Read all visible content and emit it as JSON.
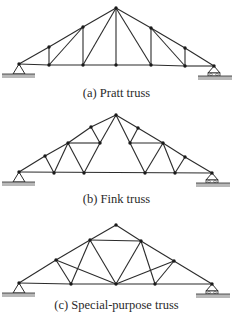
{
  "colors": {
    "member": "#2b2b2b",
    "node": "#1a1a1a",
    "ground": "#b8b8b8"
  },
  "figures": [
    {
      "id": "pratt",
      "caption": "(a) Pratt truss",
      "caption_y": 93,
      "nodes": [
        [
          19,
          64
        ],
        [
          49,
          47
        ],
        [
          83,
          27
        ],
        [
          116,
          8
        ],
        [
          151,
          28
        ],
        [
          185,
          48
        ],
        [
          214,
          66
        ],
        [
          49,
          65
        ],
        [
          83,
          65
        ],
        [
          116,
          65
        ],
        [
          151,
          65
        ],
        [
          185,
          66
        ]
      ],
      "members": [
        [
          0,
          1
        ],
        [
          1,
          2
        ],
        [
          2,
          3
        ],
        [
          3,
          4
        ],
        [
          4,
          5
        ],
        [
          5,
          6
        ],
        [
          0,
          7
        ],
        [
          7,
          8
        ],
        [
          8,
          9
        ],
        [
          9,
          10
        ],
        [
          10,
          11
        ],
        [
          11,
          6
        ],
        [
          1,
          7
        ],
        [
          2,
          8
        ],
        [
          3,
          9
        ],
        [
          4,
          10
        ],
        [
          5,
          11
        ],
        [
          7,
          2
        ],
        [
          8,
          3
        ],
        [
          3,
          10
        ],
        [
          4,
          11
        ]
      ],
      "pin": [
        19,
        64
      ],
      "roller": [
        214,
        66
      ]
    },
    {
      "id": "fink",
      "caption": "(b) Fink truss",
      "caption_y": 200,
      "nodes": [
        [
          19,
          172
        ],
        [
          45,
          156
        ],
        [
          68,
          127
        ],
        [
          91,
          143
        ],
        [
          116,
          115
        ],
        [
          138,
          128
        ],
        [
          163,
          143
        ],
        [
          185,
          157
        ],
        [
          212,
          173
        ],
        [
          54,
          173
        ],
        [
          84,
          173
        ],
        [
          100,
          143
        ],
        [
          130,
          143
        ],
        [
          145,
          173
        ],
        [
          175,
          173
        ]
      ],
      "members": [
        [
          0,
          1
        ],
        [
          1,
          2
        ],
        [
          2,
          3
        ],
        [
          3,
          4
        ]
      ],
      "pin": [
        19,
        172
      ],
      "roller": [
        212,
        173
      ]
    },
    {
      "id": "special",
      "caption": "(c) Special-purpose truss",
      "caption_y": 305,
      "nodes": [
        [
          19,
          283
        ],
        [
          56,
          260
        ],
        [
          90,
          240
        ],
        [
          116,
          225
        ],
        [
          141,
          241
        ],
        [
          174,
          261
        ],
        [
          212,
          284
        ],
        [
          71,
          284
        ],
        [
          116,
          284
        ],
        [
          155,
          284
        ]
      ],
      "members": [
        [
          0,
          1
        ],
        [
          1,
          2
        ],
        [
          2,
          3
        ],
        [
          3,
          4
        ],
        [
          4,
          5
        ],
        [
          5,
          6
        ],
        [
          0,
          7
        ],
        [
          7,
          8
        ],
        [
          8,
          9
        ],
        [
          9,
          6
        ],
        [
          2,
          4
        ],
        [
          1,
          7
        ],
        [
          7,
          2
        ],
        [
          2,
          8
        ],
        [
          8,
          4
        ],
        [
          4,
          9
        ],
        [
          9,
          5
        ],
        [
          1,
          8
        ],
        [
          8,
          5
        ]
      ],
      "pin": [
        19,
        283
      ],
      "roller": [
        212,
        284
      ]
    }
  ]
}
